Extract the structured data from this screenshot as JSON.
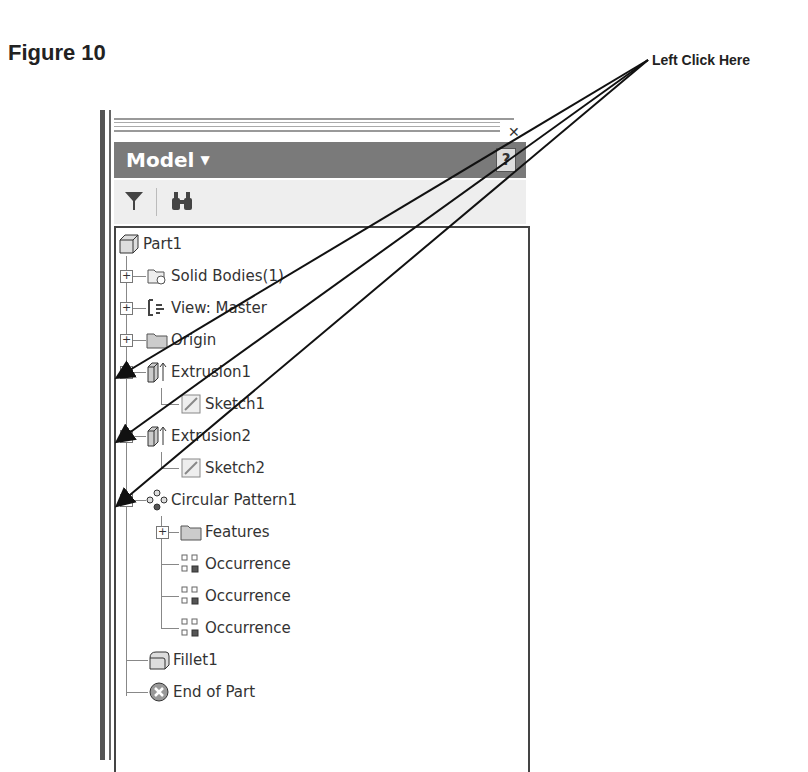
{
  "figure": {
    "title": "Figure 10"
  },
  "callout": {
    "text": "Left Click Here"
  },
  "panel": {
    "close_icon": "✕",
    "header": {
      "title": "Model",
      "caret": "▼",
      "help": "?"
    },
    "toolbar": {
      "filter": "filter-icon",
      "find": "binoculars-icon"
    }
  },
  "tree": {
    "root": "Part1",
    "items": [
      {
        "label": "Solid Bodies(1)",
        "expander": "+"
      },
      {
        "label": "View: Master",
        "expander": "+"
      },
      {
        "label": "Origin",
        "expander": "+"
      },
      {
        "label": "Extrusion1",
        "expander": "−"
      },
      {
        "label": "Sketch1"
      },
      {
        "label": "Extrusion2",
        "expander": "−"
      },
      {
        "label": "Sketch2"
      },
      {
        "label": "Circular Pattern1",
        "expander": "−"
      },
      {
        "label": "Features",
        "expander": "+"
      },
      {
        "label": "Occurrence"
      },
      {
        "label": "Occurrence"
      },
      {
        "label": "Occurrence"
      },
      {
        "label": "Fillet1"
      },
      {
        "label": "End of Part"
      }
    ]
  }
}
